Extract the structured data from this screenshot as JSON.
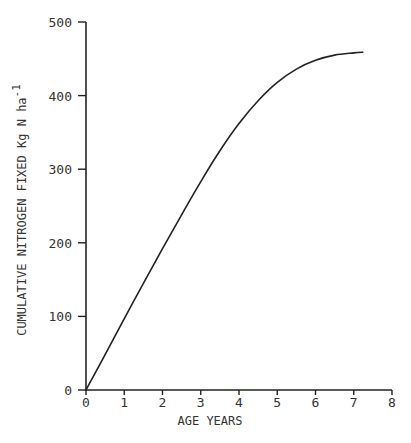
{
  "chart_data": {
    "type": "line",
    "title": "",
    "xlabel": "AGE YEARS",
    "ylabel": "CUMULATIVE NITROGEN FIXED Kg N ha",
    "ylabel_superscript": "-1",
    "xlim": [
      0,
      8
    ],
    "ylim": [
      0,
      500
    ],
    "x_ticks": [
      "0",
      "1",
      "2",
      "3",
      "4",
      "5",
      "6",
      "7",
      "8"
    ],
    "y_ticks": [
      "0",
      "100",
      "200",
      "300",
      "400",
      "500"
    ],
    "grid": false,
    "legend": null,
    "series": [
      {
        "name": "Cumulative nitrogen fixed",
        "x": [
          0,
          0.5,
          1,
          1.5,
          2,
          2.5,
          3,
          3.5,
          4,
          4.5,
          5,
          5.5,
          6,
          6.5,
          7,
          7.25
        ],
        "y": [
          0,
          48,
          97,
          145,
          192,
          238,
          283,
          325,
          362,
          393,
          418,
          436,
          448,
          455,
          458,
          459
        ]
      }
    ]
  },
  "colors": {
    "line": "#222222",
    "axis": "#222222",
    "background": "#ffffff"
  }
}
